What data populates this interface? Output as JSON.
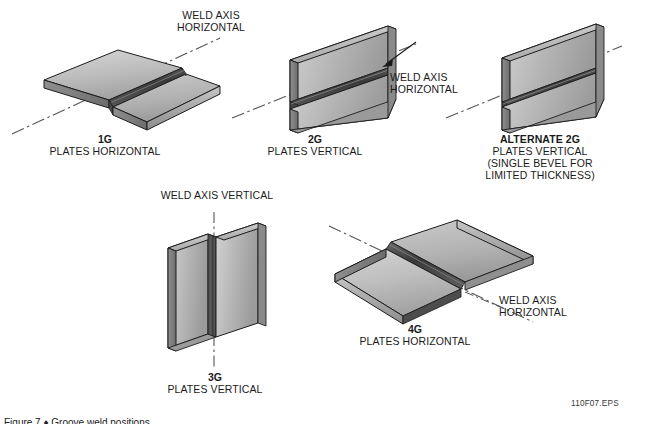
{
  "figure": {
    "code": "110F07.EPS",
    "caption": "Figure 7 ♦ Groove weld positions."
  },
  "positions": [
    {
      "id": "1g",
      "name": "1G",
      "axis_label": "WELD AXIS\nHORIZONTAL",
      "title": "1G",
      "subtitle": "PLATES HORIZONTAL",
      "notes": ""
    },
    {
      "id": "2g",
      "name": "2G",
      "axis_label": "WELD AXIS\nHORIZONTAL",
      "title": "2G",
      "subtitle": "PLATES VERTICAL",
      "notes": ""
    },
    {
      "id": "alt2g",
      "name": "ALTERNATE 2G",
      "axis_label": "",
      "title": "ALTERNATE 2G",
      "subtitle": "PLATES VERTICAL",
      "notes": "(SINGLE BEVEL FOR\nLIMITED THICKNESS)"
    },
    {
      "id": "3g",
      "name": "3G",
      "axis_label": "WELD AXIS VERTICAL",
      "title": "3G",
      "subtitle": "PLATES VERTICAL",
      "notes": ""
    },
    {
      "id": "4g",
      "name": "4G",
      "axis_label": "WELD AXIS\nHORIZONTAL",
      "title": "4G",
      "subtitle": "PLATES HORIZONTAL",
      "notes": ""
    }
  ],
  "labels": {
    "weld_axis_horizontal_top": "WELD AXIS\nHORIZONTAL",
    "weld_axis_horizontal_right": "WELD AXIS\nHORIZONTAL",
    "weld_axis_vertical": "WELD AXIS VERTICAL",
    "weld_axis_horizontal_4g": "WELD AXIS\nHORIZONTAL",
    "title_1g": "1G",
    "sub_1g": "PLATES HORIZONTAL",
    "title_2g": "2G",
    "sub_2g": "PLATES VERTICAL",
    "title_alt2g": "ALTERNATE 2G",
    "sub_alt2g": "PLATES VERTICAL",
    "note_alt2g_1": "(SINGLE BEVEL FOR",
    "note_alt2g_2": "LIMITED THICKNESS)",
    "title_3g": "3G",
    "sub_3g": "PLATES VERTICAL",
    "title_4g": "4G",
    "sub_4g": "PLATES HORIZONTAL"
  },
  "colors": {
    "background": "#ffffff",
    "plate_top_light": "#cfcfcf",
    "plate_top_dark": "#a8a8a8",
    "plate_face_light": "#c4c4c4",
    "plate_face_dark": "#8e8e8e",
    "plate_edge": "#767676",
    "weld_dark": "#3c3c3c",
    "weld_mid": "#5e5e5e",
    "outline": "#1a1a1a",
    "axis_line": "#555555",
    "text": "#1a1a1a"
  }
}
